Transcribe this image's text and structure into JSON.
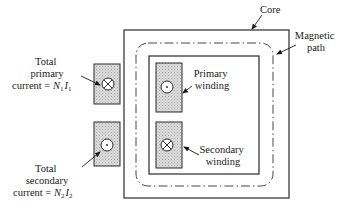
{
  "labels": {
    "core": "Core",
    "magnetic_path": [
      "Magnetic",
      "path"
    ],
    "primary_winding": [
      "Primary",
      "winding"
    ],
    "secondary_winding": [
      "Secondary",
      "winding"
    ],
    "total_primary": [
      "Total",
      "primary",
      "current = "
    ],
    "total_primary_symbol": {
      "N": "N",
      "n_sub": "1",
      "I": "I",
      "i_sub": "1"
    },
    "total_secondary": [
      "Total",
      "secondary",
      "current = "
    ],
    "total_secondary_symbol": {
      "N": "N",
      "n_sub": "2",
      "I": "I",
      "i_sub": "2"
    }
  },
  "symbols": {
    "left_primary": "current-into-page (cross)",
    "left_secondary": "current-out-of-page (dot)",
    "right_primary": "current-out-of-page (dot)",
    "right_secondary": "current-into-page (cross)"
  },
  "colors": {
    "line": "#2a2a2a",
    "winding_fill": "#d4d4d4",
    "background": "#ffffff"
  }
}
